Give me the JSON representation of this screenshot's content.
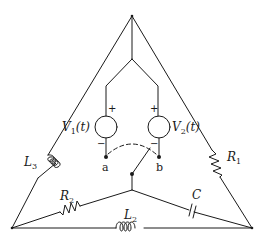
{
  "diagram": {
    "type": "circuit-schematic",
    "components": {
      "source_1": {
        "label": "V",
        "sub": "1",
        "arg": "(t)",
        "plus": "+",
        "minus": "−"
      },
      "source_2": {
        "label": "V",
        "sub": "2",
        "arg": "(t)",
        "plus": "+",
        "minus": "−"
      },
      "inductor_L3": {
        "label": "L",
        "sub": "3"
      },
      "inductor_L2": {
        "label": "L",
        "sub": "2"
      },
      "resistor_R1": {
        "label": "R",
        "sub": "1"
      },
      "resistor_R2": {
        "label": "R",
        "sub": "2"
      },
      "capacitor_C": {
        "label": "C"
      }
    },
    "nodes": {
      "a": "a",
      "b": "b"
    },
    "switch": {
      "state": "toward b",
      "alternate": "toward a (dashed arc)"
    }
  }
}
